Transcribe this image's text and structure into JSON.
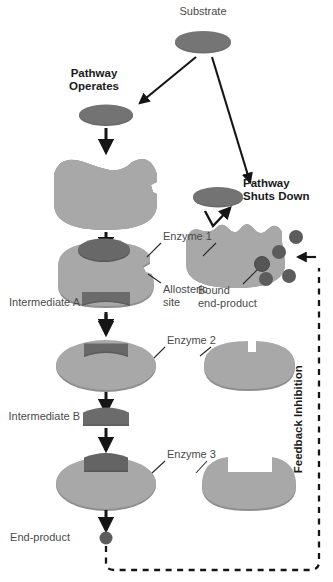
{
  "figure": {
    "type": "biochemistry-diagram"
  },
  "colors": {
    "enzyme_body": "#a8a8a8",
    "enzyme_body_shadow": "#8e8e8e",
    "substrate": "#6d6d6d",
    "substrate_dark": "#5e5e5e",
    "end_product": "#5c5c5c",
    "arrow": "#151515",
    "label_plain": "#4a4a4a",
    "label_bold": "#1a1a1a",
    "background": "#ffffff"
  },
  "labels": {
    "substrate": "Substrate",
    "pathway_operates_line1": "Pathway",
    "pathway_operates_line2": "Operates",
    "pathway_shuts_line1": "Pathway",
    "pathway_shuts_line2": "Shuts Down",
    "enzyme1": "Enzyme 1",
    "enzyme2": "Enzyme 2",
    "enzyme3": "Enzyme 3",
    "allosteric_line1": "Allosteric",
    "allosteric_line2": "site",
    "bound_line1": "Bound",
    "bound_line2": "end-product",
    "intermediate_a": "Intermediate A",
    "intermediate_b": "Intermediate B",
    "end_product": "End-product",
    "feedback_inhibition": "Feedback Inhibition"
  },
  "left_pathway": {
    "name": "active-pathway",
    "steps": [
      {
        "id": "substrate-copy",
        "label": "Substrate",
        "shape": "ellipse"
      },
      {
        "id": "enzyme-1",
        "label": "Enzyme 1",
        "shape": "enzyme-with-notch"
      },
      {
        "id": "intermediate-a",
        "label": "Intermediate A",
        "shape": "crescent"
      },
      {
        "id": "enzyme-2",
        "label": "Enzyme 2",
        "shape": "enzyme-with-notch"
      },
      {
        "id": "intermediate-b",
        "label": "Intermediate B",
        "shape": "dome"
      },
      {
        "id": "enzyme-3",
        "label": "Enzyme 3",
        "shape": "enzyme-with-notch"
      },
      {
        "id": "end-product",
        "label": "End-product",
        "shape": "circle"
      }
    ]
  },
  "right_pathway": {
    "name": "inhibited-pathway",
    "steps": [
      {
        "id": "substrate-rejected",
        "label": "Substrate",
        "shape": "ellipse"
      },
      {
        "id": "enzyme-1-inhibited",
        "label": "Enzyme 1",
        "shape": "enzyme-distorted"
      },
      {
        "id": "enzyme-2-empty",
        "label": "Enzyme 2",
        "shape": "enzyme-empty"
      },
      {
        "id": "enzyme-3-empty",
        "label": "Enzyme 3",
        "shape": "enzyme-empty"
      }
    ],
    "free_end_product_count": 4,
    "bound_end_product_count": 1
  }
}
